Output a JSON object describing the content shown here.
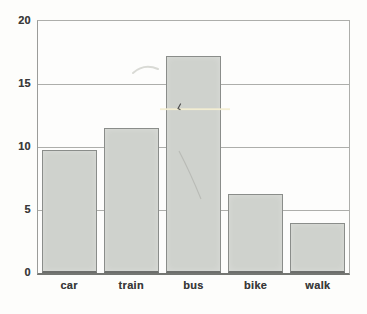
{
  "chart_data": {
    "type": "bar",
    "title": "",
    "xlabel": "",
    "ylabel": "",
    "categories": [
      "car",
      "train",
      "bus",
      "bike",
      "walk"
    ],
    "values": [
      9.8,
      11.5,
      17.2,
      6.3,
      4.0
    ],
    "ylim": [
      0,
      20
    ],
    "yticks": [
      0,
      5,
      10,
      15,
      20
    ],
    "grid": "horizontal-behind-bars",
    "legend": "none",
    "colors": {
      "bar_fill": "#cfd2cd",
      "bar_border": "#8a8d8a",
      "bar_bottom_edge": "#6d6f6c",
      "gridline": "#adaeab",
      "axis_line": "#9b9c99",
      "baseline": "#747672",
      "label_text": "#3a3a3a",
      "background": "#fdfdfb"
    },
    "layout": {
      "plot_left_px": 37,
      "plot_top_px": 20,
      "plot_width_px": 311,
      "plot_height_px": 252,
      "bar_width_px": 55
    }
  }
}
